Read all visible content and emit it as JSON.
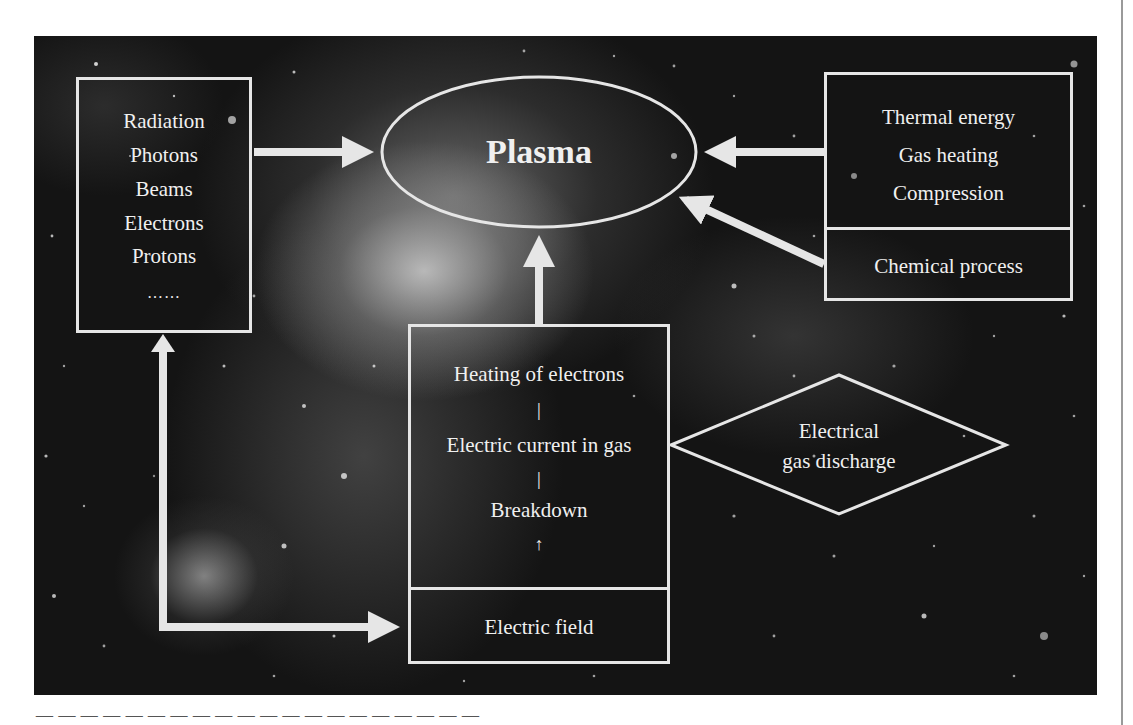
{
  "diagram": {
    "center_node": {
      "label": "Plasma",
      "shape": "ellipse"
    },
    "left_box": {
      "items": [
        "Radiation",
        "Photons",
        "Beams",
        "Electrons",
        "Protons",
        "……"
      ]
    },
    "right_box": {
      "top_items": [
        "Thermal energy",
        "Gas heating",
        "Compression"
      ],
      "bottom_item": "Chemical process"
    },
    "center_box": {
      "steps": [
        "Heating of electrons",
        "|",
        "Electric current in gas",
        "|",
        "Breakdown",
        "↑"
      ],
      "bottom_item": "Electric field"
    },
    "diamond": {
      "lines": [
        "Electrical",
        "gas discharge"
      ]
    },
    "edges": [
      {
        "from": "left_box",
        "to": "center_node",
        "type": "arrow"
      },
      {
        "from": "right_box.top",
        "to": "center_node",
        "type": "arrow"
      },
      {
        "from": "right_box.bottom",
        "to": "center_node",
        "type": "arrow"
      },
      {
        "from": "center_box",
        "to": "center_node",
        "type": "arrow"
      },
      {
        "from": "center_box.bottom",
        "to": "left_box",
        "type": "double-arrow"
      },
      {
        "from": "diamond",
        "to": "center_box",
        "type": "link"
      }
    ],
    "colors": {
      "line": "#e6e6e6",
      "text": "#f0f0f0",
      "background": "#141414",
      "page": "#ffffff"
    }
  },
  "caption_fragment": "(clipped line of text below figure — unreadable)"
}
